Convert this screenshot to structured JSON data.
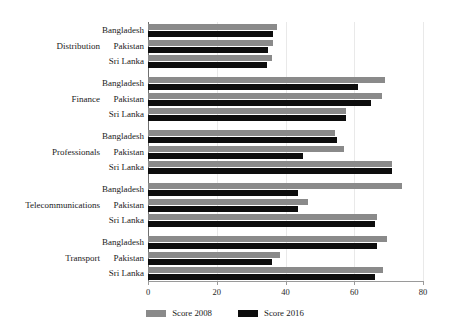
{
  "chart_data": {
    "type": "bar",
    "orientation": "horizontal",
    "title": "",
    "subtitle": "",
    "xlabel": "",
    "ylabel": "",
    "xlim": [
      0,
      80
    ],
    "xticks": [
      0,
      20,
      40,
      60,
      80
    ],
    "xtick_labels": [
      "0",
      "20",
      "40",
      "60",
      "80"
    ],
    "grid": true,
    "grid_axis": "x",
    "legend_position": "bottom-center",
    "legend": [
      {
        "name": "Score 2008",
        "color": "#8a8a8a"
      },
      {
        "name": "Score 2016",
        "color": "#0d0d0d"
      }
    ],
    "series": [
      {
        "name": "Score 2008",
        "color": "#8a8a8a",
        "values": [
          37.5,
          36.5,
          36,
          69,
          68,
          57.5,
          54.5,
          57,
          71,
          74,
          46.5,
          66.5,
          69.5,
          38.5,
          68.5
        ]
      },
      {
        "name": "Score 2016",
        "color": "#0d0d0d",
        "values": [
          36.5,
          35,
          34.5,
          61,
          65,
          57.5,
          55,
          45,
          71,
          43.5,
          43.5,
          66,
          66.5,
          36,
          66
        ]
      }
    ],
    "groups": [
      {
        "label": "Distribution",
        "categories": [
          "Bangladesh",
          "Pakistan",
          "Sri Lanka"
        ],
        "score_2008": [
          37.5,
          36.5,
          36
        ],
        "score_2016": [
          36.5,
          35,
          34.5
        ]
      },
      {
        "label": "Finance",
        "categories": [
          "Bangladesh",
          "Pakistan",
          "Sri Lanka"
        ],
        "score_2008": [
          69,
          68,
          57.5
        ],
        "score_2016": [
          61,
          65,
          57.5
        ]
      },
      {
        "label": "Professionals",
        "categories": [
          "Bangladesh",
          "Pakistan",
          "Sri Lanka"
        ],
        "score_2008": [
          54.5,
          57,
          71
        ],
        "score_2016": [
          55,
          45,
          71
        ]
      },
      {
        "label": "Telecommunications",
        "categories": [
          "Bangladesh",
          "Pakistan",
          "Sri Lanka"
        ],
        "score_2008": [
          74,
          46.5,
          66.5
        ],
        "score_2016": [
          43.5,
          43.5,
          66
        ]
      },
      {
        "label": "Transport",
        "categories": [
          "Bangladesh",
          "Pakistan",
          "Sri Lanka"
        ],
        "score_2008": [
          69.5,
          38.5,
          68.5
        ],
        "score_2016": [
          66.5,
          36,
          66
        ]
      }
    ]
  },
  "axis": {
    "tick_0": "0",
    "tick_1": "20",
    "tick_2": "40",
    "tick_3": "60",
    "tick_4": "80"
  },
  "legend": {
    "item_0_label": "Score 2008",
    "item_1_label": "Score 2016"
  },
  "groups": {
    "g0_label": "Distribution",
    "g1_label": "Finance",
    "g2_label": "Professionals",
    "g3_label": "Telecommunications",
    "g4_label": "Transport"
  },
  "countries": {
    "bangladesh": "Bangladesh",
    "pakistan": "Pakistan",
    "sri_lanka": "Sri Lanka"
  }
}
